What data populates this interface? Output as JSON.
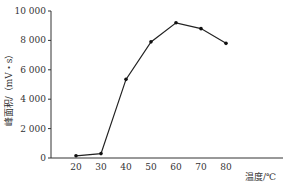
{
  "chart_data": {
    "type": "line",
    "title": "",
    "xlabel": "温度/℃",
    "ylabel": "峰面积/（mV・s）",
    "x": [
      20,
      30,
      40,
      50,
      60,
      70,
      80
    ],
    "series": [
      {
        "name": "峰面积",
        "values": [
          150,
          300,
          5350,
          7900,
          9200,
          8800,
          7800
        ]
      }
    ],
    "xticks": [
      20,
      30,
      40,
      50,
      60,
      70,
      80
    ],
    "xtick_labels": [
      "20",
      "30",
      "40",
      "50",
      "60",
      "70",
      "80"
    ],
    "yticks": [
      0,
      2000,
      4000,
      6000,
      8000,
      10000
    ],
    "ytick_labels": [
      "0",
      "2 000",
      "4 000",
      "6 000",
      "8 000",
      "10 000"
    ],
    "ylim": [
      0,
      10000
    ],
    "xlim": [
      10,
      100
    ],
    "grid": false,
    "legend": "none",
    "markers": "filled-circle",
    "colors": {
      "line": "#222222",
      "axis": "#333333"
    }
  }
}
